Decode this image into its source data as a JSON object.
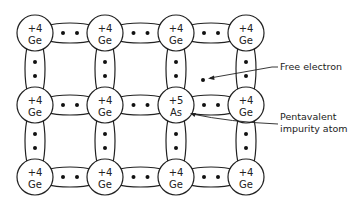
{
  "diagram": {
    "grid": {
      "cols_x": [
        35,
        105,
        176,
        246
      ],
      "rows_y": [
        33,
        105,
        177
      ],
      "atom_radius": 18
    },
    "atoms": [
      {
        "row": 0,
        "col": 0,
        "charge": "+4",
        "symbol": "Ge"
      },
      {
        "row": 0,
        "col": 1,
        "charge": "+4",
        "symbol": "Ge"
      },
      {
        "row": 0,
        "col": 2,
        "charge": "+4",
        "symbol": "Ge"
      },
      {
        "row": 0,
        "col": 3,
        "charge": "+4",
        "symbol": "Ge"
      },
      {
        "row": 1,
        "col": 0,
        "charge": "+4",
        "symbol": "Ge"
      },
      {
        "row": 1,
        "col": 1,
        "charge": "+4",
        "symbol": "Ge"
      },
      {
        "row": 1,
        "col": 2,
        "charge": "+5",
        "symbol": "As"
      },
      {
        "row": 1,
        "col": 3,
        "charge": "+4",
        "symbol": "Ge"
      },
      {
        "row": 2,
        "col": 0,
        "charge": "+4",
        "symbol": "Ge"
      },
      {
        "row": 2,
        "col": 1,
        "charge": "+4",
        "symbol": "Ge"
      },
      {
        "row": 2,
        "col": 2,
        "charge": "+4",
        "symbol": "Ge"
      },
      {
        "row": 2,
        "col": 3,
        "charge": "+4",
        "symbol": "Ge"
      }
    ],
    "labels": {
      "free_electron": "Free electron",
      "pentavalent_line1": "Pentavalent",
      "pentavalent_line2": "impurity atom"
    },
    "colors": {
      "line": "#222222",
      "background": "#ffffff"
    }
  }
}
